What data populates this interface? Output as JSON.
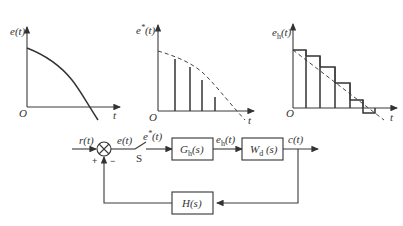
{
  "plots": {
    "continuous": {
      "ylabel": "e(t)",
      "xlabel": "t",
      "origin": "O"
    },
    "sampled": {
      "ylabel_base": "e",
      "ylabel_sup": "*",
      "ylabel_arg": "(t)",
      "xlabel": "t",
      "origin": "O"
    },
    "held": {
      "ylabel_base": "e",
      "ylabel_sub": "h",
      "ylabel_arg": "(t)",
      "xlabel": "t",
      "origin": "O"
    }
  },
  "block_diagram": {
    "input": "r(t)",
    "error": "e(t)",
    "sampled_error_base": "e",
    "sampled_error_sup": "*",
    "sampled_error_arg": "(t)",
    "switch_label": "S",
    "plus_sign": "+",
    "minus_sign": "−",
    "hold_block": {
      "base": "G",
      "sub": "h",
      "arg": "(s)"
    },
    "held_signal": {
      "base": "e",
      "sub": "h",
      "arg": "(t)"
    },
    "plant_block": {
      "base": "W",
      "sub": "d",
      "arg": " (s)"
    },
    "output": "c(t)",
    "feedback_block": "H(s)"
  }
}
